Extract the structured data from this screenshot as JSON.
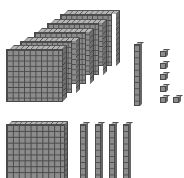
{
  "diagram": {
    "subject": "base-ten blocks",
    "groups": [
      {
        "name": "thousands-cube-stack",
        "block_type": "flat",
        "count": 5
      },
      {
        "name": "tens-rod-single",
        "block_type": "rod",
        "count": 1
      },
      {
        "name": "ones-units",
        "block_type": "unit",
        "count": 6
      },
      {
        "name": "bottom-flat",
        "block_type": "flat",
        "count": 1
      },
      {
        "name": "bottom-rods",
        "block_type": "rod",
        "count": 4
      }
    ],
    "colors": {
      "block_face": "#8c8c8c",
      "grid_line": "#4a4a4a",
      "block_top": "#b5b5b5",
      "block_side": "#6e6e6e",
      "background": "#ffffff"
    }
  }
}
